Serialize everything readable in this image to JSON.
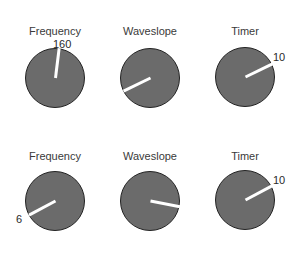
{
  "rows": [
    {
      "knobs": [
        {
          "label": "Frequency",
          "value": "160",
          "angle_deg": 7
        },
        {
          "label": "Waveslope",
          "value": "",
          "angle_deg": -116
        },
        {
          "label": "Timer",
          "value": "10",
          "angle_deg": 64
        }
      ]
    },
    {
      "knobs": [
        {
          "label": "Frequency",
          "value": "6",
          "angle_deg": -118
        },
        {
          "label": "Waveslope",
          "value": "",
          "angle_deg": 101
        },
        {
          "label": "Timer",
          "value": "10",
          "angle_deg": 62
        }
      ]
    }
  ],
  "colors": {
    "knob_fill": "#6b6b6b",
    "knob_border": "#222222",
    "needle": "#ffffff"
  }
}
